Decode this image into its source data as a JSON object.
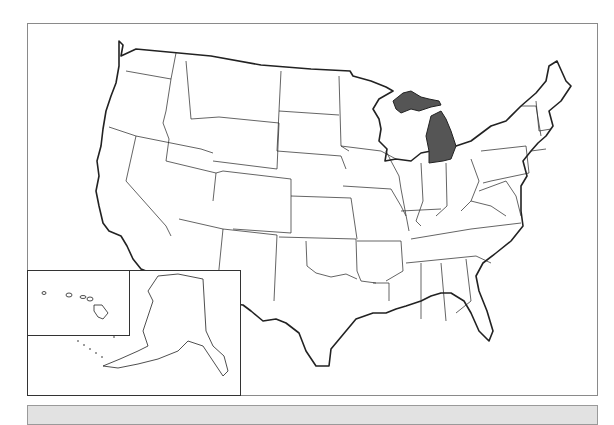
{
  "map": {
    "title": "United States map",
    "highlighted_state": "Michigan",
    "highlight_color": "#555555",
    "state_fill": "#ffffff",
    "border_color": "#222222",
    "insets": [
      "Hawaii",
      "Alaska"
    ]
  },
  "bottom_bar": {
    "color": "#e2e2e2"
  }
}
